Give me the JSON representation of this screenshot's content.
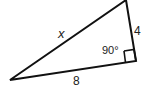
{
  "diagram": {
    "type": "right-triangle",
    "labels": {
      "hypotenuse": "x",
      "short_leg": "4",
      "long_leg": "8",
      "right_angle": "90°"
    },
    "colors": {
      "stroke": "#111111",
      "background": "#ffffff"
    }
  }
}
